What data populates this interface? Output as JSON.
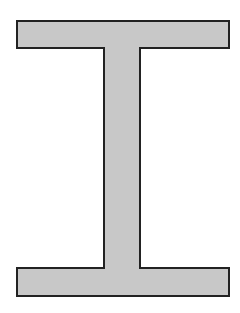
{
  "diagram": {
    "shape": "I-beam cross-section",
    "fill_color": "#c8c8c8",
    "stroke_color": "#222222",
    "top_flange": {
      "x": 17,
      "y": 21,
      "width": 212,
      "height": 27
    },
    "web": {
      "x": 104,
      "y": 48,
      "width": 36,
      "height": 220
    },
    "bottom_flange": {
      "x": 17,
      "y": 268,
      "width": 212,
      "height": 28
    }
  }
}
